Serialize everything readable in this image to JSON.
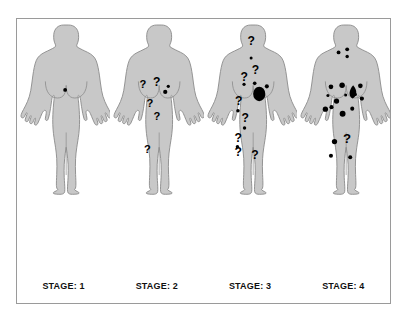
{
  "illustration": {
    "title": "Breast cancer staging silhouettes",
    "background_color": "#ffffff",
    "frame_border_color": "#9a9a9a",
    "body_fill_color": "#c8c8c8",
    "body_outline_color": "#8c8c8c",
    "marker_color": "#000000",
    "label_color": "#101010"
  },
  "stages": [
    {
      "id": "stage-1",
      "label": "STAGE: 1",
      "number": "1",
      "spot_count": 1,
      "question_mark_count": 0,
      "has_large_tumor": false,
      "spots": [
        {
          "cx": 47.5,
          "cy": 66.0,
          "r": 1.9
        }
      ],
      "question_marks": []
    },
    {
      "id": "stage-2",
      "label": "STAGE: 2",
      "number": "2",
      "spot_count": 2,
      "question_mark_count": 5,
      "has_large_tumor": false,
      "spots": [
        {
          "cx": 57.5,
          "cy": 62.5,
          "r": 1.6
        },
        {
          "cx": 54.5,
          "cy": 68.0,
          "r": 2.1
        }
      ],
      "question_marks": [
        {
          "x": 29.0,
          "y": 64.0,
          "size": 11
        },
        {
          "x": 42.5,
          "y": 62.0,
          "size": 12
        },
        {
          "x": 36.0,
          "y": 83.0,
          "size": 11
        },
        {
          "x": 43.0,
          "y": 96.0,
          "size": 11
        },
        {
          "x": 33.5,
          "y": 128.0,
          "size": 11
        }
      ]
    },
    {
      "id": "stage-3",
      "label": "STAGE: 3",
      "number": "3",
      "spot_count": 7,
      "question_mark_count": 8,
      "has_large_tumor": true,
      "large_tumor": {
        "cx": 54.5,
        "cy": 70.0,
        "rx": 6.0,
        "ry": 7.2
      },
      "spots": [
        {
          "cx": 46.5,
          "cy": 34.5,
          "r": 1.5
        },
        {
          "cx": 50.0,
          "cy": 59.5,
          "r": 1.8
        },
        {
          "cx": 62.0,
          "cy": 62.5,
          "r": 2.0
        },
        {
          "cx": 39.5,
          "cy": 60.5,
          "r": 1.6
        },
        {
          "cx": 33.5,
          "cy": 86.5,
          "r": 1.7
        },
        {
          "cx": 40.0,
          "cy": 103.5,
          "r": 1.7
        },
        {
          "cx": 33.0,
          "cy": 122.0,
          "r": 1.7
        }
      ],
      "question_marks": [
        {
          "x": 43.0,
          "y": 22.0,
          "size": 12
        },
        {
          "x": 47.0,
          "y": 50.0,
          "size": 12
        },
        {
          "x": 36.0,
          "y": 57.0,
          "size": 12
        },
        {
          "x": 30.5,
          "y": 81.0,
          "size": 12
        },
        {
          "x": 37.0,
          "y": 98.0,
          "size": 12
        },
        {
          "x": 30.0,
          "y": 117.0,
          "size": 12
        },
        {
          "x": 30.0,
          "y": 131.0,
          "size": 12
        },
        {
          "x": 46.5,
          "y": 134.0,
          "size": 12
        }
      ]
    },
    {
      "id": "stage-4",
      "label": "STAGE: 4",
      "number": "4",
      "spot_count": 18,
      "question_mark_count": 1,
      "has_large_tumor": true,
      "large_tumor": {
        "cx": 55.0,
        "cy": 68.0,
        "rx": 4.0,
        "ry": 6.5
      },
      "spots": [
        {
          "cx": 41.0,
          "cy": 29.0,
          "r": 1.9
        },
        {
          "cx": 49.5,
          "cy": 26.0,
          "r": 1.9
        },
        {
          "cx": 49.5,
          "cy": 33.0,
          "r": 1.7
        },
        {
          "cx": 33.5,
          "cy": 63.0,
          "r": 2.3
        },
        {
          "cx": 44.5,
          "cy": 61.5,
          "r": 2.7
        },
        {
          "cx": 62.5,
          "cy": 62.0,
          "r": 2.3
        },
        {
          "cx": 64.0,
          "cy": 74.5,
          "r": 2.1
        },
        {
          "cx": 39.0,
          "cy": 77.0,
          "r": 2.6
        },
        {
          "cx": 34.0,
          "cy": 83.0,
          "r": 2.0
        },
        {
          "cx": 28.0,
          "cy": 85.0,
          "r": 2.6
        },
        {
          "cx": 45.0,
          "cy": 89.5,
          "r": 2.9
        },
        {
          "cx": 54.5,
          "cy": 84.5,
          "r": 2.0
        },
        {
          "cx": 37.0,
          "cy": 117.0,
          "r": 2.6
        },
        {
          "cx": 33.5,
          "cy": 131.0,
          "r": 2.0
        },
        {
          "cx": 52.5,
          "cy": 132.5,
          "r": 2.0
        },
        {
          "cx": 57.5,
          "cy": 70.5,
          "r": 1.6
        },
        {
          "cx": 48.0,
          "cy": 71.0,
          "r": 1.5
        },
        {
          "cx": 30.5,
          "cy": 71.5,
          "r": 1.5
        }
      ],
      "question_marks": [
        {
          "x": 45.5,
          "y": 118.0,
          "size": 13
        }
      ]
    }
  ]
}
